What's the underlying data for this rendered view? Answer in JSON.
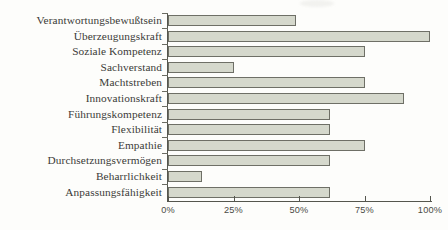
{
  "chart_data": {
    "type": "bar",
    "orientation": "horizontal",
    "title": "",
    "subtitle": "",
    "xlabel": "",
    "ylabel": "",
    "xlim": [
      0,
      100
    ],
    "grid": false,
    "legend": false,
    "legend_position": "none",
    "unit": "%",
    "axis_ticks": [
      "0%",
      "25%",
      "50%",
      "75%",
      "100%"
    ],
    "axis_tick_values": [
      0,
      25,
      50,
      75,
      100
    ],
    "categories": [
      "Verantwortungsbewußtsein",
      "Überzeugungskraft",
      "Soziale Kompetenz",
      "Sachverstand",
      "Machtstreben",
      "Innovationskraft",
      "Führungskompetenz",
      "Flexibilität",
      "Empathie",
      "Durchsetzungsvermögen",
      "Beharrlichkeit",
      "Anpassungsfähigkeit"
    ],
    "values": [
      49,
      100,
      75,
      25,
      75,
      90,
      62,
      62,
      75,
      62,
      13,
      62
    ],
    "colors": {
      "bar_fill": "#d5d8cc",
      "bar_border": "#6e6f66",
      "axis": "#55564e",
      "label_text": "#3b3b38",
      "tick_text": "#4a4a45",
      "background": "#fdfdfb"
    }
  }
}
